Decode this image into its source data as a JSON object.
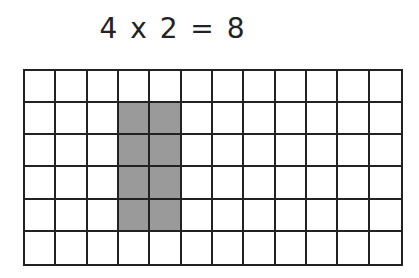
{
  "equation": {
    "text": "4 x 2 = 8",
    "factor_a": 4,
    "factor_b": 2,
    "product": 8
  },
  "grid": {
    "rows": 6,
    "cols": 12,
    "shaded_region": {
      "row_start": 2,
      "row_end": 5,
      "col_start": 4,
      "col_end": 5
    },
    "colors": {
      "line": "#222222",
      "shade": "#9a9a9a",
      "empty": "#ffffff"
    }
  }
}
